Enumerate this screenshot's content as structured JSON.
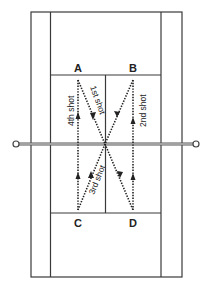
{
  "diagram": {
    "positions": [
      {
        "id": "A",
        "label": "A"
      },
      {
        "id": "B",
        "label": "B"
      },
      {
        "id": "C",
        "label": "C"
      },
      {
        "id": "D",
        "label": "D"
      }
    ],
    "shots": [
      {
        "label": "1st shot",
        "from": "A",
        "to": "D"
      },
      {
        "label": "2nd shot",
        "from": "D",
        "to": "B"
      },
      {
        "label": "3rd shot",
        "from": "B",
        "to": "C"
      },
      {
        "label": "4th shot",
        "from": "C",
        "to": "A"
      }
    ],
    "colors": {
      "lines": "#3a3a3a",
      "background": "#ffffff"
    }
  }
}
